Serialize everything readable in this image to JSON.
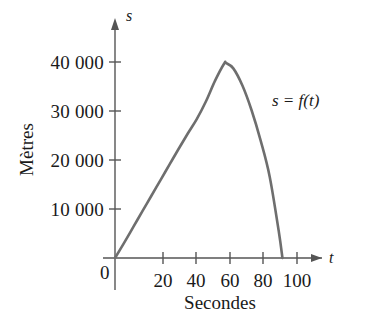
{
  "chart_data": {
    "type": "line",
    "title": "",
    "xlabel": "Secondes",
    "ylabel": "Mètres",
    "x_axis_variable": "t",
    "y_axis_variable": "s",
    "curve_label": "s = f(t)",
    "grid": false,
    "legend_position": "inline-annotation",
    "xlim": [
      0,
      105
    ],
    "ylim": [
      0,
      45000
    ],
    "x_ticks": [
      20,
      40,
      60,
      80,
      100
    ],
    "x_tick_labels": [
      "20",
      "40",
      "60",
      "80",
      "100"
    ],
    "y_ticks": [
      10000,
      20000,
      30000,
      40000
    ],
    "y_tick_labels": [
      "10 000",
      "20 000",
      "30 000",
      "40 000"
    ],
    "origin_label": "0",
    "series": [
      {
        "name": "s = f(t)",
        "color": "#6e6e6e",
        "x": [
          0,
          5,
          10,
          15,
          20,
          25,
          30,
          35,
          40,
          45,
          50,
          55,
          60,
          61,
          65,
          70,
          75,
          80,
          85,
          90,
          92
        ],
        "values": [
          0,
          3100,
          6300,
          9500,
          12700,
          15900,
          19100,
          22300,
          25400,
          28400,
          32000,
          36200,
          39700,
          39800,
          38700,
          35200,
          30200,
          24000,
          16600,
          5400,
          0
        ]
      }
    ],
    "annotations": [
      {
        "text": "s = f(t)",
        "x": 82,
        "y": 32000
      }
    ],
    "peak": {
      "x": 61,
      "y": 39800
    },
    "x_intercepts": [
      0,
      92
    ]
  },
  "axes": {
    "x_arrow": "arrow-right",
    "y_arrow": "arrow-up",
    "axis_color": "#555555",
    "curve_color": "#6e6e6e"
  }
}
